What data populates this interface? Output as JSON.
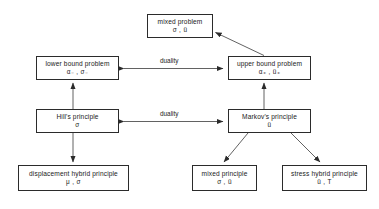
{
  "diagram": {
    "type": "flow-diagram",
    "title": "",
    "nodes": [
      {
        "id": "mixed-problem",
        "title": "mixed problem",
        "symbols": "σ , ü",
        "x": 147,
        "y": 14,
        "w": 66,
        "h": 24
      },
      {
        "id": "lower-bound-problem",
        "title": "lower bound problem",
        "symbols": "α₋ , σ₋",
        "x": 36,
        "y": 56,
        "w": 83,
        "h": 24
      },
      {
        "id": "upper-bound-problem",
        "title": "upper bound problem",
        "symbols": "α₊ , ü₊",
        "x": 228,
        "y": 56,
        "w": 83,
        "h": 24
      },
      {
        "id": "hills-principle",
        "title": "Hill's principle",
        "symbols": "σ",
        "x": 36,
        "y": 109,
        "w": 83,
        "h": 24
      },
      {
        "id": "markovs-principle",
        "title": "Markov's principle",
        "symbols": "ü",
        "x": 228,
        "y": 109,
        "w": 83,
        "h": 24
      },
      {
        "id": "displacement-hybrid-principle",
        "title": "displacement hybrid principle",
        "symbols": "μ , σ",
        "x": 18,
        "y": 165,
        "w": 111,
        "h": 26
      },
      {
        "id": "mixed-principle",
        "title": "mixed principle",
        "symbols": "σ , ü",
        "x": 192,
        "y": 165,
        "w": 65,
        "h": 26
      },
      {
        "id": "stress-hybrid-principle",
        "title": "stress hybrid principle",
        "symbols": "ü , T",
        "x": 282,
        "y": 165,
        "w": 85,
        "h": 26
      }
    ],
    "edges": [
      {
        "id": "upper-to-mixed",
        "from": "upper-bound-problem",
        "to": "mixed-problem",
        "label": "",
        "arrow": "single"
      },
      {
        "id": "lower-upper-duality",
        "from": "lower-bound-problem",
        "to": "upper-bound-problem",
        "label": "duality",
        "arrow": "double"
      },
      {
        "id": "hill-markov-duality",
        "from": "hills-principle",
        "to": "markovs-principle",
        "label": "duality",
        "arrow": "double"
      },
      {
        "id": "hill-to-lower",
        "from": "hills-principle",
        "to": "lower-bound-problem",
        "label": "",
        "arrow": "single"
      },
      {
        "id": "markov-to-upper",
        "from": "markovs-principle",
        "to": "upper-bound-problem",
        "label": "",
        "arrow": "single"
      },
      {
        "id": "hill-to-displacement",
        "from": "hills-principle",
        "to": "displacement-hybrid-principle",
        "label": "",
        "arrow": "single"
      },
      {
        "id": "markov-to-mixed-principle",
        "from": "markovs-principle",
        "to": "mixed-principle",
        "label": "",
        "arrow": "single"
      },
      {
        "id": "markov-to-stress-hybrid",
        "from": "markovs-principle",
        "to": "stress-hybrid-principle",
        "label": "",
        "arrow": "single"
      }
    ],
    "labels": {
      "duality_top": "duality",
      "duality_bottom": "duality"
    },
    "colors": {
      "background": "#ffffff",
      "box_border": "#2b2b2b",
      "text": "#1a1a1a",
      "edge": "#3a3a3a"
    }
  }
}
